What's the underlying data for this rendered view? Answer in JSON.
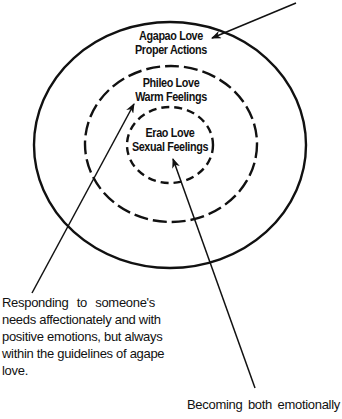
{
  "diagram": {
    "type": "concentric-ellipses",
    "colors": {
      "stroke": "#111111",
      "background": "#ffffff"
    },
    "rings": [
      {
        "id": "agapao",
        "title": "Agapao Love",
        "subtitle": "Proper Actions",
        "style": "solid"
      },
      {
        "id": "phileo",
        "title": "Phileo Love",
        "subtitle": "Warm Feelings",
        "style": "dashed"
      },
      {
        "id": "erao",
        "title": "Erao Love",
        "subtitle": "Sexual Feelings",
        "style": "dashed"
      }
    ],
    "annotations": {
      "phileo_description": {
        "lines": [
          "Responding to someone's",
          "needs affectionately and with",
          "positive emotions, but always",
          "within the guidelines of agape",
          "love."
        ]
      },
      "erao_description": {
        "lines": [
          "Becoming both emotionally"
        ]
      }
    }
  }
}
